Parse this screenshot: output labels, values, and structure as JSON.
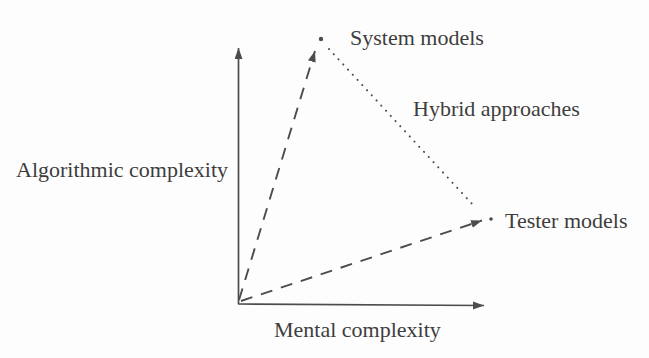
{
  "figure": {
    "type": "conceptual-diagram",
    "colors": {
      "ink": "#3d3d3d",
      "line": "#4c4c4c",
      "background": "#fdfdfd"
    },
    "axes": {
      "y_label": "Algorithmic complexity",
      "x_label": "Mental complexity"
    },
    "labels": {
      "system_models": "System models",
      "tester_models": "Tester models",
      "hybrid_approaches": "Hybrid approaches",
      "algorithmic_complexity": "Algorithmic complexity",
      "mental_complexity": "Mental complexity"
    },
    "nodes": [
      {
        "id": "origin",
        "label": ""
      },
      {
        "id": "system-models",
        "label": "System models",
        "position": "high algorithmic complexity, low mental complexity"
      },
      {
        "id": "tester-models",
        "label": "Tester models",
        "position": "high mental complexity, low algorithmic complexity"
      }
    ],
    "edges": [
      {
        "from": "origin",
        "to": "system-models",
        "style": "dashed-arrow",
        "label": ""
      },
      {
        "from": "origin",
        "to": "tester-models",
        "style": "dashed-arrow",
        "label": ""
      },
      {
        "from": "system-models",
        "to": "tester-models",
        "style": "dotted",
        "label": "Hybrid approaches"
      }
    ]
  }
}
